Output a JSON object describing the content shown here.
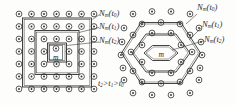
{
  "figure": {
    "caption_fragment": "",
    "background_color": "#fdfdfc",
    "ink_color": "#2b2b2b"
  },
  "left_diagram": {
    "name": "square-lattice-neighborhood-diagram",
    "lattice_type": "square",
    "center_label": "m",
    "rings": [
      {
        "label_html": "N",
        "sub": "m",
        "arg": "t",
        "arg_sub": "0"
      },
      {
        "label_html": "N",
        "sub": "m",
        "arg": "t",
        "arg_sub": "1"
      },
      {
        "label_html": "N",
        "sub": "m",
        "arg": "t",
        "arg_sub": "2"
      }
    ],
    "labels": {
      "ring0": "N",
      "ring0_sub": "m",
      "ring0_arg": "t",
      "ring0_arg_sub": "0",
      "ring1": "N",
      "ring1_sub": "m",
      "ring1_arg": "t",
      "ring1_arg_sub": "1",
      "ring2": "N",
      "ring2_sub": "m",
      "ring2_arg": "t",
      "ring2_arg_sub": "2"
    },
    "time_ordering": {
      "t2": "t",
      "t2_sub": "2",
      "gt1": ">",
      "t1": "t",
      "t1_sub": "1",
      "gt2": ">",
      "t0": "t",
      "t0_sub": "0"
    },
    "grid": {
      "cols": 7,
      "rows": 7,
      "node_glyph": "dot-in-circle"
    }
  },
  "right_diagram": {
    "name": "hexagonal-lattice-neighborhood-diagram",
    "lattice_type": "hexagonal",
    "center_label": "m",
    "labels": {
      "ring0": "N",
      "ring0_sub": "m",
      "ring0_arg": "t",
      "ring0_arg_sub": "0",
      "ring1": "N",
      "ring1_sub": "m",
      "ring1_arg": "t",
      "ring1_arg_sub": "1",
      "ring2": "N",
      "ring2_sub": "m",
      "ring2_arg": "t",
      "ring2_arg_sub": "2"
    }
  },
  "edge_artifact": {
    "text": "cropped vertical text"
  },
  "paren": {
    "open": "(",
    "close": ")"
  }
}
